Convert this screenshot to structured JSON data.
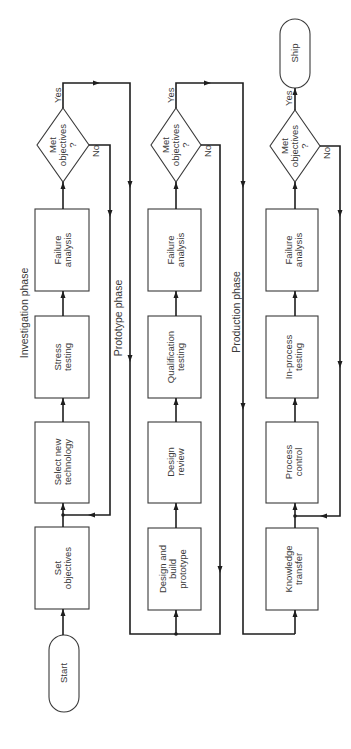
{
  "diagram": {
    "orientation": "rotated 90 degrees counter-clockwise",
    "terminals": {
      "start": "Start",
      "ship": "Ship"
    },
    "phases": [
      {
        "name": "Investigation phase",
        "steps": [
          {
            "line1": "Set",
            "line2": "objectives",
            "line3": ""
          },
          {
            "line1": "Select new",
            "line2": "technology",
            "line3": ""
          },
          {
            "line1": "Stress",
            "line2": "testing",
            "line3": ""
          },
          {
            "line1": "Failure",
            "line2": "analysis",
            "line3": ""
          }
        ],
        "decision": {
          "line1": "Met",
          "line2": "objectives",
          "line3": "?",
          "yes": "Yes",
          "no": "No"
        }
      },
      {
        "name": "Prototype phase",
        "steps": [
          {
            "line1": "Design and",
            "line2": "build",
            "line3": "prototype"
          },
          {
            "line1": "Design",
            "line2": "review",
            "line3": ""
          },
          {
            "line1": "Qualification",
            "line2": "testing",
            "line3": ""
          },
          {
            "line1": "Failure",
            "line2": "analysis",
            "line3": ""
          }
        ],
        "decision": {
          "line1": "Met",
          "line2": "objectives",
          "line3": "?",
          "yes": "Yes",
          "no": "No"
        }
      },
      {
        "name": "Production phase",
        "steps": [
          {
            "line1": "Knowledge",
            "line2": "transfer",
            "line3": ""
          },
          {
            "line1": "Process",
            "line2": "control",
            "line3": ""
          },
          {
            "line1": "In-process",
            "line2": "testing",
            "line3": ""
          },
          {
            "line1": "Failure",
            "line2": "analysis",
            "line3": ""
          }
        ],
        "decision": {
          "line1": "Met",
          "line2": "objectives",
          "line3": "?",
          "yes": "Yes",
          "no": "No"
        }
      }
    ]
  }
}
